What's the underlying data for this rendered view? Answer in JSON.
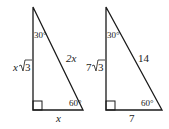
{
  "diagram": {
    "type": "two 30-60-90 right triangles",
    "stroke_color": "#1a1a1a",
    "triangles": [
      {
        "id": "general",
        "top_angle": "30°",
        "bottom_angle": "60°",
        "long_leg_coef": "x",
        "long_leg_radical": "3",
        "hypotenuse": "2x",
        "short_leg": "x"
      },
      {
        "id": "example",
        "top_angle": "30°",
        "bottom_angle": "60°",
        "long_leg_coef": "7",
        "long_leg_radical": "3",
        "hypotenuse": "14",
        "short_leg": "7"
      }
    ]
  }
}
